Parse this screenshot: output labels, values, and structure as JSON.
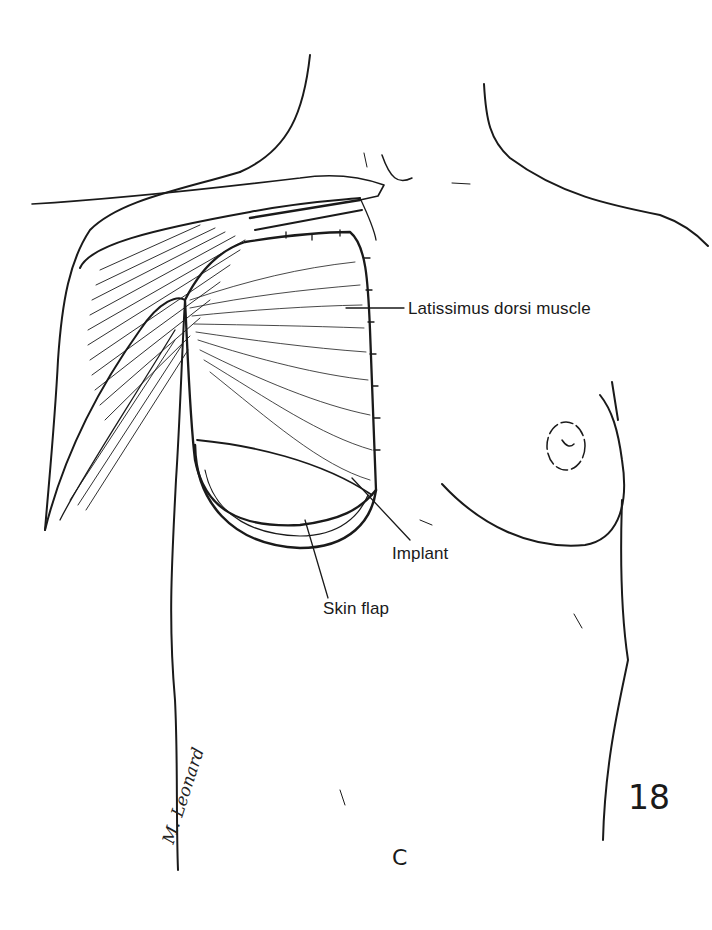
{
  "figure": {
    "number": "18",
    "panel_letter": "C",
    "signature": "M. Leonard",
    "labels": {
      "muscle": "Latissimus dorsi muscle",
      "implant": "Implant",
      "skin_flap": "Skin flap"
    },
    "colors": {
      "ink": "#1a1a1a",
      "background": "#ffffff"
    }
  }
}
